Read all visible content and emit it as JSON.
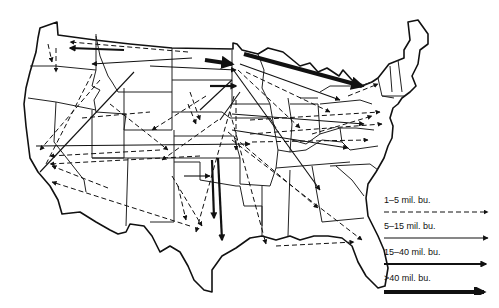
{
  "map": {
    "subject": "Interregional grain flows, United States",
    "legend": {
      "items": [
        {
          "label": "1–5 mil. bu.",
          "style": "dashed-thin"
        },
        {
          "label": "5–15 mil. bu.",
          "style": "solid-thin"
        },
        {
          "label": "15–40 mil. bu.",
          "style": "solid-medium"
        },
        {
          ">40": true,
          "label": ">40 mil. bu.",
          "style": "solid-thick"
        }
      ]
    },
    "major_flows": [
      {
        "from": "Montana/North Dakota",
        "to": "Minnesota",
        "class": ">40 mil. bu."
      },
      {
        "from": "Minnesota",
        "to": "New York/Great Lakes",
        "class": ">40 mil. bu."
      },
      {
        "from": "Kansas/Oklahoma",
        "to": "Texas Gulf",
        "class": "15-40 mil. bu."
      }
    ]
  }
}
